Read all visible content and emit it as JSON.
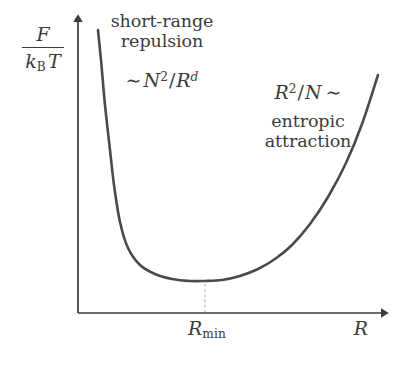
{
  "figure": {
    "kind": "free-energy-vs-radius-sketch",
    "background_color": "#ffffff",
    "curve_color": "#4a4a4a",
    "axis_color": "#3b3b3b",
    "text_color": "#3b3b3b",
    "guide_color": "#a8a8a8"
  },
  "axes": {
    "y_label_numerator": "F",
    "y_label_denominator_k": "k",
    "y_label_denominator_k_sub": "B",
    "y_label_denominator_T": "T",
    "x_label": "R",
    "x_tick_label_base": "R",
    "x_tick_label_sub": "min"
  },
  "annotations": {
    "left_line1": "short-range",
    "left_line2": "repulsion",
    "left_formula_tilde": "∼",
    "left_formula_N": "N",
    "left_formula_N_exp": "2",
    "left_formula_slash": "/",
    "left_formula_R": "R",
    "left_formula_R_exp": "d",
    "right_formula_R": "R",
    "right_formula_R_exp": "2",
    "right_formula_slash": "/",
    "right_formula_N": "N",
    "right_formula_tilde": "∼",
    "right_line1": "entropic",
    "right_line2": "attraction"
  },
  "chart_data": {
    "type": "line",
    "title": "",
    "xlabel": "R",
    "ylabel": "F / (k_B T)",
    "grid": false,
    "legend": null,
    "axis_style": "arrowed-L-axes",
    "annotated_minimum": {
      "x_label": "R_min",
      "x_px": 205,
      "y_px": 281,
      "guide_line": "dashed-vertical-to-x-axis"
    },
    "axis_pixel_geometry": {
      "origin_x": 78,
      "origin_y": 313,
      "y_axis_top": 13,
      "x_axis_right": 390
    },
    "curve_points_px": [
      [
        98,
        30
      ],
      [
        101,
        60
      ],
      [
        105,
        105
      ],
      [
        110,
        150
      ],
      [
        114,
        185
      ],
      [
        120,
        222
      ],
      [
        128,
        248
      ],
      [
        140,
        265
      ],
      [
        155,
        274
      ],
      [
        172,
        279
      ],
      [
        190,
        281
      ],
      [
        205,
        281
      ],
      [
        222,
        280
      ],
      [
        240,
        276
      ],
      [
        258,
        269
      ],
      [
        275,
        259
      ],
      [
        292,
        245
      ],
      [
        310,
        224
      ],
      [
        328,
        197
      ],
      [
        346,
        163
      ],
      [
        362,
        124
      ],
      [
        378,
        75
      ]
    ],
    "asymptotic_laws": {
      "small_R": "~ N^2 / R^d",
      "large_R": "R^2 / N ~"
    }
  }
}
